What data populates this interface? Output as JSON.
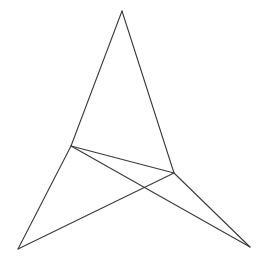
{
  "figure": {
    "background_color": "#ffffff",
    "line_color": "#3a3a3a",
    "line_width": 1.1,
    "canvas": {
      "width": 267,
      "height": 262
    },
    "vertices": [
      {
        "id": "A",
        "name": "apex",
        "x": 122,
        "y": 11
      },
      {
        "id": "B",
        "name": "left-middle",
        "x": 71,
        "y": 146
      },
      {
        "id": "C",
        "name": "right-middle",
        "x": 174,
        "y": 173
      },
      {
        "id": "D",
        "name": "bottom-left",
        "x": 18,
        "y": 249
      },
      {
        "id": "E",
        "name": "bottom-right",
        "x": 250,
        "y": 247
      }
    ],
    "segments": [
      {
        "id": "AB",
        "name": "apex-to-left-middle",
        "x1": 122,
        "y1": 11,
        "x2": 71,
        "y2": 146
      },
      {
        "id": "AC",
        "name": "apex-to-right-middle",
        "x1": 122,
        "y1": 11,
        "x2": 174,
        "y2": 173
      },
      {
        "id": "BC",
        "name": "left-middle-to-right-middle",
        "x1": 71,
        "y1": 146,
        "x2": 174,
        "y2": 173
      },
      {
        "id": "BD",
        "name": "left-middle-to-bottom-left",
        "x1": 71,
        "y1": 146,
        "x2": 18,
        "y2": 249
      },
      {
        "id": "BE",
        "name": "left-middle-to-bottom-right",
        "x1": 71,
        "y1": 146,
        "x2": 250,
        "y2": 247
      },
      {
        "id": "CD",
        "name": "right-middle-to-bottom-left",
        "x1": 174,
        "y1": 173,
        "x2": 18,
        "y2": 249
      },
      {
        "id": "CE",
        "name": "right-middle-to-bottom-right",
        "x1": 174,
        "y1": 173,
        "x2": 250,
        "y2": 247
      }
    ],
    "intersections": [
      {
        "id": "X1",
        "name": "crossing-of-BE-and-CD",
        "x": 155,
        "y": 188
      }
    ],
    "labels": []
  }
}
